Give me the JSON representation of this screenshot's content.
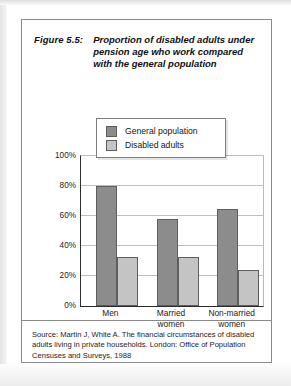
{
  "figure": {
    "number": "Figure 5.5:",
    "caption": "Proportion of disabled adults under pension age who work compared with the general population",
    "source": "Source: Martin J, White A. The financial circumstances of disabled adults living in private households. London: Office of Population Censuses and Surveys, 1988"
  },
  "colors": {
    "general": "#8c8c8c",
    "disabled": "#c4c4c4",
    "axis": "#2b2b2b",
    "grid": "#bdbdbd",
    "border": "#8a8a8a"
  },
  "chart_data": {
    "type": "bar",
    "title": "Proportion of disabled adults under pension age who work compared with the general population",
    "xlabel": "",
    "ylabel": "",
    "ylim": [
      0,
      100
    ],
    "yticks": [
      "0%",
      "20%",
      "40%",
      "60%",
      "80%",
      "100%"
    ],
    "ytick_values": [
      0,
      20,
      40,
      60,
      80,
      100
    ],
    "grid": true,
    "legend_position": "top-center",
    "categories": [
      "Men",
      "Married women",
      "Non-married women"
    ],
    "category_lines": [
      [
        "Men"
      ],
      [
        "Married",
        "women"
      ],
      [
        "Non-married",
        "women"
      ]
    ],
    "series": [
      {
        "name": "General population",
        "values": [
          80,
          58,
          65
        ]
      },
      {
        "name": "Disabled adults",
        "values": [
          33,
          33,
          24
        ]
      }
    ]
  }
}
